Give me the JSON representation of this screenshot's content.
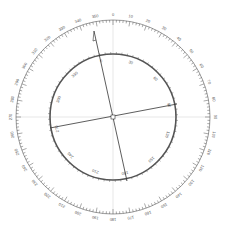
{
  "diagram": {
    "type": "compass-rose",
    "center": [
      113,
      117
    ],
    "outer_ring": {
      "radius": 97,
      "label_step_deg": 10,
      "labels": [
        "0",
        "10",
        "20",
        "30",
        "40",
        "50",
        "60",
        "70",
        "80",
        "90",
        "100",
        "110",
        "120",
        "130",
        "140",
        "150",
        "160",
        "170",
        "180",
        "190",
        "200",
        "210",
        "220",
        "230",
        "240",
        "250",
        "260",
        "270",
        "280",
        "290",
        "300",
        "310",
        "320",
        "330",
        "340",
        "350"
      ]
    },
    "inner_ring": {
      "radius": 63,
      "rotation_deg": -12,
      "label_step_deg": 30,
      "labels": [
        "0",
        "30",
        "60",
        "90",
        "120",
        "150",
        "180",
        "210",
        "240",
        "270",
        "300",
        "330"
      ]
    },
    "needle": {
      "from": [
        94,
        31
      ],
      "to": [
        127,
        181
      ]
    },
    "cross_line": {
      "from": [
        50,
        128
      ],
      "to": [
        177,
        104
      ]
    },
    "colors": {
      "ring": "#555555",
      "line": "#333333",
      "grid": "#cccccc"
    }
  }
}
